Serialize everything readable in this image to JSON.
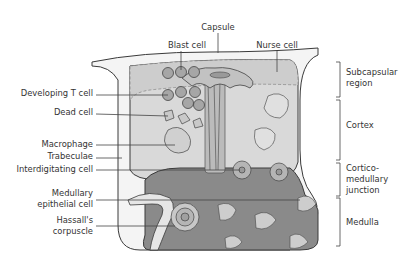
{
  "diagram": {
    "labels": {
      "capsule": "Capsule",
      "blast_cell": "Blast cell",
      "nurse_cell": "Nurse cell",
      "developing_t_cell": "Developing T cell",
      "dead_cell": "Dead cell",
      "macrophage": "Macrophage",
      "trabeculae": "Trabeculae",
      "interdigitating_cell": "Interdigitating cell",
      "medullary_epithelial_cell_1": "Medullary",
      "medullary_epithelial_cell_2": "epithelial cell",
      "hassalls_corpuscle_1": "Hassall's",
      "hassalls_corpuscle_2": "corpuscle"
    },
    "regions": {
      "subcapsular_1": "Subcapsular",
      "subcapsular_2": "region",
      "cortex": "Cortex",
      "corticomedullary_1": "Cortico-",
      "corticomedullary_2": "medullary",
      "corticomedullary_3": "junction",
      "medulla": "Medulla"
    },
    "colors": {
      "capsule_fill": "#f2f2f2",
      "cortex_fill": "#d9d9d9",
      "subcapsular_fill": "#cfcfcf",
      "medulla_fill": "#8a8a8a",
      "cell_fill": "#a8a8a8",
      "light_cell": "#cdcdcd"
    }
  }
}
